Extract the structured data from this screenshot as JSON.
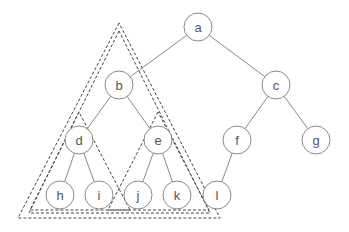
{
  "diagram": {
    "type": "binary-tree",
    "colors": {
      "edge": "#8a8a8a",
      "node_border": "#8a8a8a",
      "node_fill": "#ffffff",
      "label": "#555555",
      "subtree_outline": "#444444"
    },
    "node_radius": 14,
    "nodes": [
      {
        "id": "a",
        "label": "a",
        "x": 198,
        "y": 27
      },
      {
        "id": "b",
        "label": "b",
        "x": 119,
        "y": 85
      },
      {
        "id": "c",
        "label": "c",
        "x": 276,
        "y": 85
      },
      {
        "id": "d",
        "label": "d",
        "x": 79,
        "y": 140
      },
      {
        "id": "e",
        "label": "e",
        "x": 158,
        "y": 140
      },
      {
        "id": "f",
        "label": "f",
        "x": 237,
        "y": 140
      },
      {
        "id": "g",
        "label": "g",
        "x": 316,
        "y": 140
      },
      {
        "id": "h",
        "label": "h",
        "x": 60,
        "y": 195
      },
      {
        "id": "i",
        "label": "i",
        "x": 99,
        "y": 195
      },
      {
        "id": "j",
        "label": "j",
        "x": 138,
        "y": 195
      },
      {
        "id": "k",
        "label": "k",
        "x": 177,
        "y": 195
      },
      {
        "id": "l",
        "label": "l",
        "x": 217,
        "y": 195
      }
    ],
    "edges": [
      [
        "a",
        "b"
      ],
      [
        "a",
        "c"
      ],
      [
        "b",
        "d"
      ],
      [
        "b",
        "e"
      ],
      [
        "c",
        "f"
      ],
      [
        "c",
        "g"
      ],
      [
        "d",
        "h"
      ],
      [
        "d",
        "i"
      ],
      [
        "e",
        "j"
      ],
      [
        "e",
        "k"
      ],
      [
        "f",
        "l"
      ]
    ],
    "subtree_outlines": [
      {
        "name": "outer-subtree-b",
        "points": [
          [
            119,
            23
          ],
          [
            18,
            218
          ],
          [
            220,
            218
          ]
        ]
      },
      {
        "name": "inner-subtree-b",
        "points": [
          [
            119,
            31
          ],
          [
            29,
            213
          ],
          [
            210,
            213
          ]
        ]
      },
      {
        "name": "subtree-d",
        "points": [
          [
            79,
            112
          ],
          [
            30,
            210
          ],
          [
            130,
            210
          ]
        ]
      },
      {
        "name": "subtree-e",
        "points": [
          [
            158,
            112
          ],
          [
            108,
            210
          ],
          [
            209,
            210
          ]
        ]
      }
    ]
  }
}
